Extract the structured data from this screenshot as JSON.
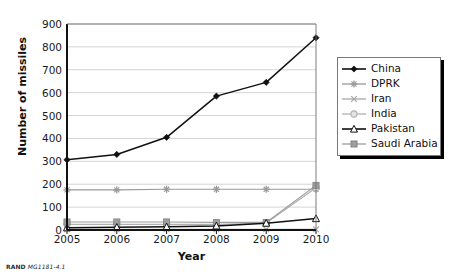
{
  "figure": {
    "credit_org": "RAND",
    "credit_id": "MG1181-4.1"
  },
  "chart_data": {
    "type": "line",
    "title": "",
    "xlabel": "Year",
    "ylabel": "Number of missiles",
    "categories": [
      "2005",
      "2006",
      "2007",
      "2008",
      "2009",
      "2010"
    ],
    "x": [
      2005,
      2006,
      2007,
      2008,
      2009,
      2010
    ],
    "xlim": [
      2005,
      2010
    ],
    "ylim": [
      0,
      900
    ],
    "yticks": [
      0,
      100,
      200,
      300,
      400,
      500,
      600,
      700,
      800,
      900
    ],
    "xticks": [
      "2005",
      "2006",
      "2007",
      "2008",
      "2009",
      "2010"
    ],
    "grid": "horizontal",
    "legend_position": "right",
    "series": [
      {
        "name": "China",
        "values": [
          307,
          330,
          405,
          585,
          645,
          840
        ],
        "color": "#111111",
        "marker": "diamond"
      },
      {
        "name": "DPRK",
        "values": [
          175,
          175,
          178,
          178,
          178,
          178
        ],
        "color": "#9a9a9a",
        "marker": "star"
      },
      {
        "name": "Iran",
        "values": [
          3,
          3,
          3,
          3,
          3,
          3
        ],
        "color": "#a8a8a8",
        "marker": "x"
      },
      {
        "name": "India",
        "values": [
          25,
          25,
          25,
          25,
          30,
          185
        ],
        "color": "#b0b0b0",
        "marker": "circle"
      },
      {
        "name": "Pakistan",
        "values": [
          10,
          12,
          14,
          18,
          30,
          50
        ],
        "color": "#111111",
        "marker": "triangle-open"
      },
      {
        "name": "Saudi Arabia",
        "values": [
          35,
          35,
          35,
          33,
          33,
          195
        ],
        "color": "#9d9d9d",
        "marker": "square"
      }
    ]
  }
}
